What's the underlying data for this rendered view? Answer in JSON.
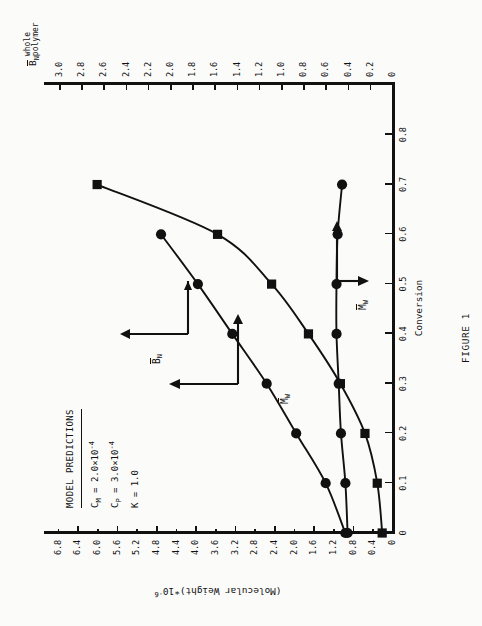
{
  "figure": {
    "caption": "FIGURE 1"
  },
  "annotation": {
    "header": "MODEL PREDICTIONS",
    "lines": [
      {
        "symbol": "C",
        "sub": "M",
        "eq": "=",
        "value": "2.0×10",
        "exp": "-4"
      },
      {
        "symbol": "C",
        "sub": "P",
        "eq": "=",
        "value": "3.0×10",
        "exp": "-4"
      },
      {
        "symbol": "K",
        "sub": "",
        "eq": "=",
        "value": "1.0",
        "exp": ""
      }
    ]
  },
  "chart_data": {
    "type": "line",
    "title": "",
    "xlabel": "Conversion",
    "ylabel": "(Molecular Weight)*10",
    "ylabel_exp": "-6",
    "ylabel_right": "B",
    "ylabel_right_sub": "N",
    "ylabel_right_sub2_line1": "whole",
    "ylabel_right_sub2_line2": "polymer",
    "xlim": [
      0,
      0.9
    ],
    "ylim": [
      0,
      7.0
    ],
    "y2lim": [
      0,
      3.1
    ],
    "grid": false,
    "legend": "none",
    "xticks": [
      0,
      0.1,
      0.2,
      0.3,
      0.4,
      0.5,
      0.6,
      0.7,
      0.8
    ],
    "xtick_labels": [
      "0",
      "0.1",
      "0.2",
      "0.3",
      "0.4",
      "0.5",
      "0.6",
      "0.7",
      "0.8"
    ],
    "yticks": [
      0,
      0.4,
      0.8,
      1.2,
      1.6,
      2.0,
      2.4,
      2.8,
      3.2,
      3.6,
      4.0,
      4.4,
      4.8,
      5.2,
      5.6,
      6.0,
      6.4,
      6.8
    ],
    "ytick_labels": [
      "0",
      "0.4",
      "0.8",
      "1.2",
      "1.6",
      "2.0",
      "2.4",
      "2.8",
      "3.2",
      "3.6",
      "4.0",
      "4.4",
      "4.8",
      "5.2",
      "5.6",
      "6.0",
      "6.4",
      "6.8"
    ],
    "y2ticks": [
      0.2,
      0.4,
      0.6,
      0.8,
      1.0,
      1.2,
      1.4,
      1.6,
      1.8,
      2.0,
      2.2,
      2.4,
      2.6,
      2.8,
      3.0
    ],
    "y2tick_labels": [
      "0.2",
      "0.4",
      "0.6",
      "0.8",
      "1.0",
      "1.2",
      "1.4",
      "1.6",
      "1.8",
      "2.0",
      "2.2",
      "2.4",
      "2.6",
      "2.8",
      "3.0"
    ],
    "series": [
      {
        "name": "Mw",
        "label_symbol": "M",
        "label_sub": "W",
        "axis": "left",
        "marker": "circle",
        "x": [
          0.0,
          0.1,
          0.2,
          0.3,
          0.4,
          0.5,
          0.6
        ],
        "values": [
          0.95,
          1.35,
          1.95,
          2.55,
          3.25,
          3.95,
          4.7
        ]
      },
      {
        "name": "Mw-squares",
        "label_symbol": "M",
        "label_sub": "W",
        "axis": "left",
        "marker": "square",
        "x": [
          0.0,
          0.1,
          0.2,
          0.3,
          0.4,
          0.5,
          0.6,
          0.7
        ],
        "values": [
          0.2,
          0.3,
          0.55,
          1.05,
          1.7,
          2.45,
          3.55,
          6.0
        ]
      },
      {
        "name": "Bn",
        "label_symbol": "B",
        "label_sub": "N",
        "axis": "right",
        "marker": "circle",
        "x": [
          0.0,
          0.1,
          0.2,
          0.3,
          0.4,
          0.5,
          0.6,
          0.7
        ],
        "values": [
          0.4,
          0.42,
          0.46,
          0.48,
          0.5,
          0.5,
          0.49,
          0.45
        ]
      }
    ],
    "annotations": [
      {
        "text": "Bn-label",
        "kind": "series-label"
      },
      {
        "text": "Mw-label",
        "kind": "series-label"
      },
      {
        "text": "Mn-label",
        "kind": "series-label"
      }
    ]
  }
}
